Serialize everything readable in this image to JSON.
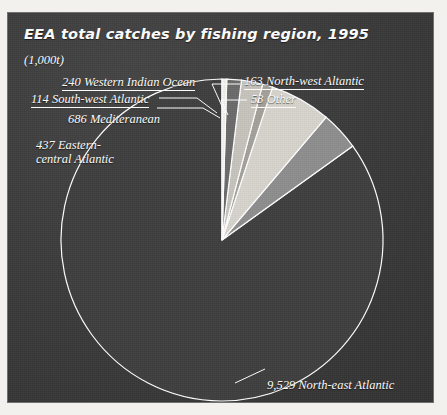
{
  "header": {
    "title": "EEA total catches by fishing region, 1995",
    "units": "(1,000t)"
  },
  "colors": {
    "panel_background": "#3a3a3a",
    "text": "#ffffff",
    "outline": "#ffffff",
    "slice_north_east_atlantic": "#3f3f3f",
    "slice_eastern_central_atlantic": "#8e8e8e",
    "slice_mediterranean": "#d6d4cd",
    "slice_south_west_atlantic": "#a3a19a",
    "slice_western_indian_ocean": "#c6c4bd",
    "slice_north_west_atlantic": "#6b6b6b",
    "slice_other": "#f2f0ea"
  },
  "labels": {
    "western_indian_ocean": "240 Western Indian Ocean",
    "south_west_atlantic": "114 South-west Atlantic",
    "mediterranean": "686 Mediteranean",
    "eastern_central_atlantic_line1": "437  Eastern-",
    "eastern_central_atlantic_line2": "central Atlantic",
    "north_west_atlantic": "163  North-west Altantic",
    "other": "53  Other",
    "north_east_atlantic": "9,529  North-east Atlantic"
  },
  "chart_data": {
    "type": "pie",
    "title": "EEA total catches by fishing region, 1995",
    "subtitle": "(1,000t)",
    "unit": "1,000 t",
    "categories": [
      "North-east Atlantic",
      "Mediteranean",
      "Eastern-central Atlantic",
      "Western Indian Ocean",
      "North-west Altantic",
      "South-west Atlantic",
      "Other"
    ],
    "values": [
      9529,
      686,
      437,
      240,
      163,
      114,
      53
    ],
    "total": 11222,
    "legend": "none",
    "grid": false,
    "start_angle_deg": 0,
    "direction": "counterclockwise",
    "slices": [
      {
        "label": "North-east Atlantic",
        "value": 9529,
        "color": "#3f3f3f"
      },
      {
        "label": "Eastern-central Atlantic",
        "value": 437,
        "color": "#8e8e8e"
      },
      {
        "label": "Mediteranean",
        "value": 686,
        "color": "#d6d4cd"
      },
      {
        "label": "South-west Atlantic",
        "value": 114,
        "color": "#a3a19a"
      },
      {
        "label": "Western Indian Ocean",
        "value": 240,
        "color": "#c6c4bd"
      },
      {
        "label": "North-west Altantic",
        "value": 163,
        "color": "#6b6b6b"
      },
      {
        "label": "Other",
        "value": 53,
        "color": "#f2f0ea"
      }
    ]
  }
}
